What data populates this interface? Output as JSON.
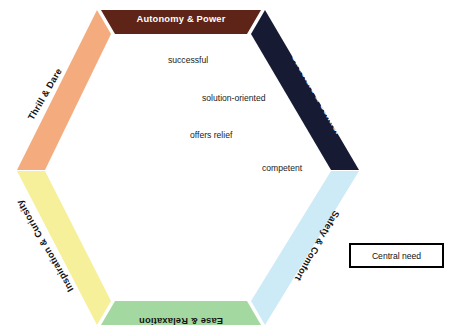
{
  "diagram": {
    "type": "hexagon-needs-wheel",
    "title": "",
    "segments": [
      {
        "id": "autonomy-power",
        "label": "Autonomy & Power",
        "position": "top",
        "fill": "#5E2418",
        "text_color": "#FFFFFF",
        "rotation": 0
      },
      {
        "id": "structure-control",
        "label": "Structure & Control",
        "position": "top-right",
        "fill": "#161A33",
        "text_color": "#FFFFFF",
        "rotation": 60
      },
      {
        "id": "safety-comfort",
        "label": "Safety & Comfort",
        "position": "bottom-right",
        "fill": "#CDEAF7",
        "text_color": "#15120F",
        "rotation": -60
      },
      {
        "id": "ease-relaxation",
        "label": "Ease & Relaxation",
        "position": "bottom",
        "fill": "#A3D9A0",
        "text_color": "#15120F",
        "rotation": 0
      },
      {
        "id": "inspiration-curiosity",
        "label": "Inspiration & Curiosity",
        "position": "bottom-left",
        "fill": "#F6F09A",
        "text_color": "#15120F",
        "rotation": 60
      },
      {
        "id": "thrill-dare",
        "label": "Thrill & Dare",
        "position": "top-left",
        "fill": "#F4AC7E",
        "text_color": "#15120F",
        "rotation": -60
      }
    ],
    "center_words": [
      {
        "id": "successful",
        "text": "successful",
        "x": 168,
        "y": 55
      },
      {
        "id": "solution-oriented",
        "text": "solution-oriented",
        "x": 205,
        "y": 93
      },
      {
        "id": "offers-relief",
        "text": "offers relief",
        "x": 190,
        "y": 130
      },
      {
        "id": "competent",
        "text": "competent",
        "x": 262,
        "y": 164
      }
    ]
  },
  "legend": {
    "label": "Central need",
    "border_color": "#000000",
    "background": "#FFFFFF"
  }
}
